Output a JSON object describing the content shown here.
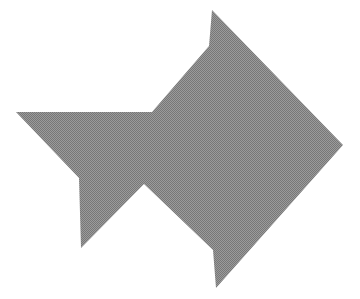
{
  "canvas": {
    "width": 360,
    "height": 299,
    "background_color": "#ffffff",
    "description": "Abstract solid gray polygon silhouette resembling a stylized arrow or fish pointing right, rendered on a plain white background"
  },
  "figure": {
    "name": "gray-arrow-polygon",
    "fill_color": "#8a8a8a",
    "fill_texture": "dithered-halftone-gray",
    "texture_dark": "#6e6e6e",
    "texture_light": "#a6a6a6",
    "stroke": "none",
    "points_label": "212,10 209,46 152,112 16,112 79,178 81,248 144,184 213,250 216,288 343,145",
    "vertices": [
      {
        "name": "top-spike-apex",
        "x": 212,
        "y": 10
      },
      {
        "name": "upper-notch",
        "x": 209,
        "y": 46
      },
      {
        "name": "upper-left-wing-junction",
        "x": 152,
        "y": 112
      },
      {
        "name": "left-wing-tip",
        "x": 16,
        "y": 112
      },
      {
        "name": "left-wing-inner-corner",
        "x": 79,
        "y": 178
      },
      {
        "name": "lower-left-spike-tip",
        "x": 81,
        "y": 248
      },
      {
        "name": "bottom-v-notch-apex",
        "x": 144,
        "y": 184
      },
      {
        "name": "lower-right-notch",
        "x": 213,
        "y": 250
      },
      {
        "name": "bottom-spike-tip",
        "x": 216,
        "y": 288
      },
      {
        "name": "right-point",
        "x": 343,
        "y": 145
      }
    ]
  }
}
